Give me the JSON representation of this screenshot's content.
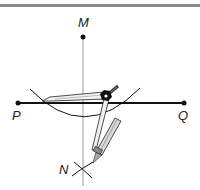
{
  "diagram": {
    "type": "geometric-construction",
    "points": [
      {
        "id": "M",
        "label": "M",
        "x": 83,
        "y": 37
      },
      {
        "id": "P",
        "label": "P",
        "x": 18,
        "y": 103
      },
      {
        "id": "Q",
        "label": "Q",
        "x": 184,
        "y": 103
      },
      {
        "id": "N",
        "label": "N",
        "x": 83,
        "y": 168
      }
    ],
    "segments": [
      {
        "from": "P",
        "to": "Q",
        "style": "thick"
      },
      {
        "from": "M",
        "to": "N",
        "style": "thin-gray"
      }
    ],
    "colors": {
      "line": "#111111",
      "perpendicular": "#9a9a9a",
      "topbar": "#8a8a8a",
      "compass_fill": "#e8e8e8"
    }
  }
}
